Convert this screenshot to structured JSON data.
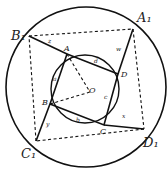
{
  "labels": {
    "B1": "B₁",
    "A1": "A₁",
    "C1": "C₁",
    "D1": "D₁",
    "A": "A",
    "B": "B",
    "C": "C",
    "D": "D",
    "O": "O",
    "a": "a",
    "b": "b",
    "c": "c",
    "d": "d",
    "w": "w",
    "x": "x",
    "y": "y",
    "z": "z"
  }
}
